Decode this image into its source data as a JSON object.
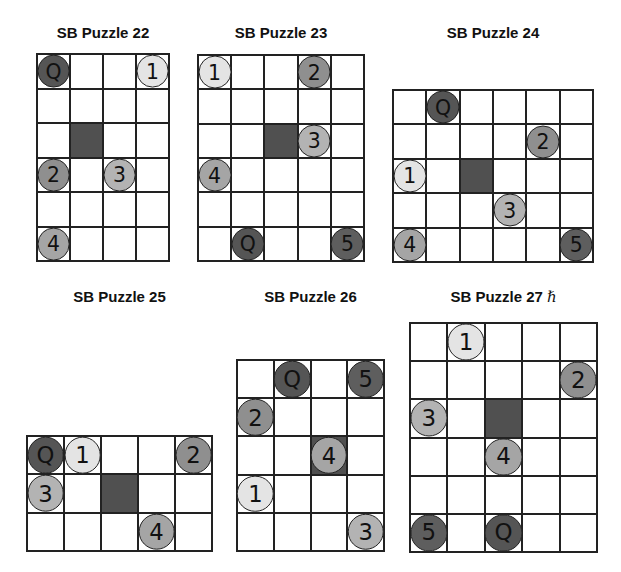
{
  "colors": {
    "grid_line": "#222222",
    "block": "#505050",
    "queen": "#555555",
    "shade_1": "#e4e4e4",
    "shade_2": "#8f8f8f",
    "shade_3": "#b3b3b3",
    "shade_4": "#a5a5a5",
    "shade_5": "#5e5e5e"
  },
  "puzzles": [
    {
      "title": "SB Puzzle 22",
      "hint": "",
      "cols": 4,
      "rows": 6,
      "box": {
        "x": 36,
        "y": 53,
        "w": 134,
        "h": 209
      },
      "title_pos": {
        "x": 36,
        "y": 24,
        "w": 134
      },
      "block": [
        2,
        1
      ],
      "pieces": [
        {
          "label": "Q",
          "row": 0,
          "col": 0
        },
        {
          "label": "1",
          "row": 0,
          "col": 3
        },
        {
          "label": "2",
          "row": 3,
          "col": 0
        },
        {
          "label": "3",
          "row": 3,
          "col": 2
        },
        {
          "label": "4",
          "row": 5,
          "col": 0
        }
      ]
    },
    {
      "title": "SB Puzzle 23",
      "hint": "",
      "cols": 5,
      "rows": 6,
      "box": {
        "x": 197,
        "y": 54,
        "w": 168,
        "h": 208
      },
      "title_pos": {
        "x": 197,
        "y": 24,
        "w": 168
      },
      "block": [
        2,
        2
      ],
      "pieces": [
        {
          "label": "1",
          "row": 0,
          "col": 0
        },
        {
          "label": "2",
          "row": 0,
          "col": 3
        },
        {
          "label": "3",
          "row": 2,
          "col": 3
        },
        {
          "label": "4",
          "row": 3,
          "col": 0
        },
        {
          "label": "Q",
          "row": 5,
          "col": 1
        },
        {
          "label": "5",
          "row": 5,
          "col": 4
        }
      ]
    },
    {
      "title": "SB Puzzle 24",
      "hint": "",
      "cols": 6,
      "rows": 5,
      "box": {
        "x": 392,
        "y": 89,
        "w": 202,
        "h": 174
      },
      "title_pos": {
        "x": 392,
        "y": 24,
        "w": 202
      },
      "block": [
        2,
        2
      ],
      "pieces": [
        {
          "label": "Q",
          "row": 0,
          "col": 1
        },
        {
          "label": "2",
          "row": 1,
          "col": 4
        },
        {
          "label": "1",
          "row": 2,
          "col": 0
        },
        {
          "label": "3",
          "row": 3,
          "col": 3
        },
        {
          "label": "4",
          "row": 4,
          "col": 0
        },
        {
          "label": "5",
          "row": 4,
          "col": 5
        }
      ]
    },
    {
      "title": "SB Puzzle 25",
      "hint": "",
      "cols": 5,
      "rows": 3,
      "box": {
        "x": 26,
        "y": 435,
        "w": 187,
        "h": 117
      },
      "title_pos": {
        "x": 26,
        "y": 288,
        "w": 187
      },
      "block": [
        1,
        2
      ],
      "pieces": [
        {
          "label": "Q",
          "row": 0,
          "col": 0
        },
        {
          "label": "1",
          "row": 0,
          "col": 1
        },
        {
          "label": "2",
          "row": 0,
          "col": 4
        },
        {
          "label": "3",
          "row": 1,
          "col": 0
        },
        {
          "label": "4",
          "row": 2,
          "col": 3
        }
      ]
    },
    {
      "title": "SB Puzzle 26",
      "hint": "",
      "cols": 4,
      "rows": 5,
      "box": {
        "x": 236,
        "y": 359,
        "w": 149,
        "h": 193
      },
      "title_pos": {
        "x": 236,
        "y": 288,
        "w": 149
      },
      "block": [
        2,
        2
      ],
      "pieces": [
        {
          "label": "Q",
          "row": 0,
          "col": 1
        },
        {
          "label": "5",
          "row": 0,
          "col": 3
        },
        {
          "label": "2",
          "row": 1,
          "col": 0
        },
        {
          "label": "4",
          "row": 2,
          "col": 2
        },
        {
          "label": "1",
          "row": 3,
          "col": 0
        },
        {
          "label": "3",
          "row": 4,
          "col": 3
        }
      ]
    },
    {
      "title": "SB Puzzle 27",
      "hint": "ℏ",
      "cols": 5,
      "rows": 6,
      "box": {
        "x": 409,
        "y": 322,
        "w": 189,
        "h": 231
      },
      "title_pos": {
        "x": 409,
        "y": 288,
        "w": 189
      },
      "block": [
        2,
        2
      ],
      "pieces": [
        {
          "label": "1",
          "row": 0,
          "col": 1
        },
        {
          "label": "2",
          "row": 1,
          "col": 4
        },
        {
          "label": "3",
          "row": 2,
          "col": 0
        },
        {
          "label": "4",
          "row": 3,
          "col": 2
        },
        {
          "label": "5",
          "row": 5,
          "col": 0
        },
        {
          "label": "Q",
          "row": 5,
          "col": 2
        }
      ]
    }
  ]
}
